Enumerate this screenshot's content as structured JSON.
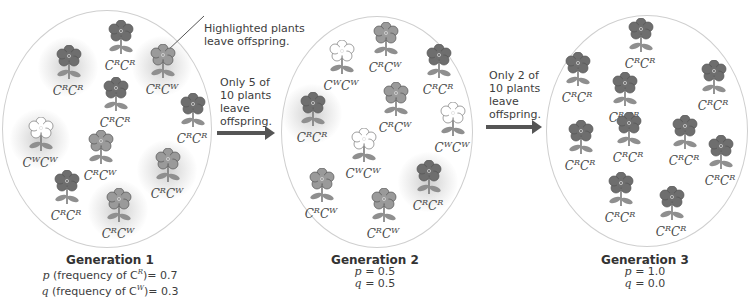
{
  "colors": {
    "red_flower": "#6e6e6e",
    "pink_flower": "#9a9a9a",
    "white_flower": "#ffffff",
    "leaf": "#8f8f8f",
    "arrow": "#555555",
    "circle_border": "#cfcfcf"
  },
  "annotations": {
    "highlighted_note_line1": "Highlighted plants",
    "highlighted_note_line2": "leave offspring.",
    "transition1_line1": "Only 5 of",
    "transition1_line2": "10 plants",
    "transition1_line3": "leave",
    "transition1_line4": "offspring.",
    "transition2_line1": "Only 2 of",
    "transition2_line2": "10 plants",
    "transition2_line3": "leave",
    "transition2_line4": "offspring."
  },
  "generations": [
    {
      "title": "Generation 1",
      "p_symbol": "p",
      "p_text": " (frequency of C",
      "p_allele": "R",
      "p_value": ")= 0.7",
      "q_symbol": "q",
      "q_text": " (frequency of C",
      "q_allele": "W",
      "q_value": ")= 0.3",
      "plants": [
        {
          "a1": "R",
          "a2": "R",
          "color": "red",
          "highlighted": false
        },
        {
          "a1": "R",
          "a2": "R",
          "color": "red",
          "highlighted": true
        },
        {
          "a1": "R",
          "a2": "W",
          "color": "pink",
          "highlighted": true
        },
        {
          "a1": "R",
          "a2": "R",
          "color": "red",
          "highlighted": false
        },
        {
          "a1": "R",
          "a2": "R",
          "color": "red",
          "highlighted": false
        },
        {
          "a1": "W",
          "a2": "W",
          "color": "white",
          "highlighted": true
        },
        {
          "a1": "R",
          "a2": "W",
          "color": "pink",
          "highlighted": false
        },
        {
          "a1": "R",
          "a2": "W",
          "color": "pink",
          "highlighted": true
        },
        {
          "a1": "R",
          "a2": "R",
          "color": "red",
          "highlighted": false
        },
        {
          "a1": "R",
          "a2": "W",
          "color": "pink",
          "highlighted": true
        }
      ]
    },
    {
      "title": "Generation 2",
      "p_symbol": "p",
      "p_value": " = 0.5",
      "q_symbol": "q",
      "q_value": " = 0.5",
      "plants": [
        {
          "a1": "W",
          "a2": "W",
          "color": "white",
          "highlighted": false
        },
        {
          "a1": "R",
          "a2": "W",
          "color": "pink",
          "highlighted": false
        },
        {
          "a1": "R",
          "a2": "R",
          "color": "red",
          "highlighted": false
        },
        {
          "a1": "R",
          "a2": "R",
          "color": "red",
          "highlighted": true
        },
        {
          "a1": "R",
          "a2": "W",
          "color": "pink",
          "highlighted": false
        },
        {
          "a1": "W",
          "a2": "W",
          "color": "white",
          "highlighted": false
        },
        {
          "a1": "W",
          "a2": "W",
          "color": "white",
          "highlighted": false
        },
        {
          "a1": "R",
          "a2": "W",
          "color": "pink",
          "highlighted": false
        },
        {
          "a1": "R",
          "a2": "R",
          "color": "red",
          "highlighted": true
        },
        {
          "a1": "R",
          "a2": "W",
          "color": "pink",
          "highlighted": false
        }
      ]
    },
    {
      "title": "Generation 3",
      "p_symbol": "p",
      "p_value": " = 1.0",
      "q_symbol": "q",
      "q_value": " = 0.0",
      "plants": [
        {
          "a1": "R",
          "a2": "R",
          "color": "red",
          "highlighted": false
        },
        {
          "a1": "R",
          "a2": "R",
          "color": "red",
          "highlighted": false
        },
        {
          "a1": "R",
          "a2": "R",
          "color": "red",
          "highlighted": false
        },
        {
          "a1": "R",
          "a2": "R",
          "color": "red",
          "highlighted": false
        },
        {
          "a1": "R",
          "a2": "R",
          "color": "red",
          "highlighted": false
        },
        {
          "a1": "R",
          "a2": "R",
          "color": "red",
          "highlighted": false
        },
        {
          "a1": "R",
          "a2": "R",
          "color": "red",
          "highlighted": false
        },
        {
          "a1": "R",
          "a2": "R",
          "color": "red",
          "highlighted": false
        },
        {
          "a1": "R",
          "a2": "R",
          "color": "red",
          "highlighted": false
        },
        {
          "a1": "R",
          "a2": "R",
          "color": "red",
          "highlighted": false
        }
      ]
    }
  ]
}
